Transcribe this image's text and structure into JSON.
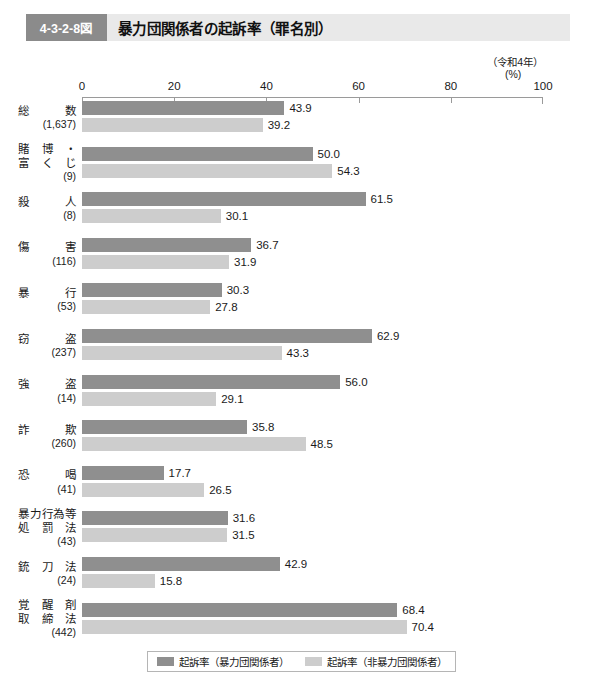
{
  "header": {
    "figure_number": "4-3-2-8図",
    "title": "暴力団関係者の起訴率（罪名別）"
  },
  "notes": {
    "year": "（令和4年）",
    "unit": "(%)"
  },
  "legend": {
    "items": [
      {
        "label": "起訴率（暴力団関係者）",
        "color": "#8f8f8f"
      },
      {
        "label": "起訴率（非暴力団関係者）",
        "color": "#cdcdcd"
      }
    ]
  },
  "chart_data": {
    "type": "bar",
    "orientation": "horizontal",
    "title": "暴力団関係者の起訴率（罪名別）",
    "subtitle": "（令和4年）",
    "xlabel": "(%)",
    "ylabel": "",
    "xlim": [
      0,
      100
    ],
    "xticks": [
      0,
      20,
      40,
      60,
      80,
      100
    ],
    "xticklabels": [
      "0",
      "20",
      "40",
      "60",
      "80",
      "100"
    ],
    "grid": false,
    "legend_position": "bottom",
    "categories": [
      {
        "name": "総　　数",
        "count": "(1,637)"
      },
      {
        "name": "賭博・\n富くじ",
        "count": "(9)",
        "lines": [
          "賭　博　・",
          "富　く　じ"
        ]
      },
      {
        "name": "殺　　人",
        "count": "(8)"
      },
      {
        "name": "傷　　害",
        "count": "(116)"
      },
      {
        "name": "暴　　行",
        "count": "(53)"
      },
      {
        "name": "窃　　盗",
        "count": "(237)"
      },
      {
        "name": "強　　盗",
        "count": "(14)"
      },
      {
        "name": "詐　　欺",
        "count": "(260)"
      },
      {
        "name": "恐　　喝",
        "count": "(41)"
      },
      {
        "name": "暴力行為等\n処罰法",
        "count": "(43)",
        "lines": [
          "暴力行為等",
          "処　罰　法"
        ]
      },
      {
        "name": "銃　刀　法",
        "count": "(24)"
      },
      {
        "name": "覚醒剤\n取締法",
        "count": "(442)",
        "lines": [
          "覚　醒　剤",
          "取　締　法"
        ]
      }
    ],
    "series": [
      {
        "name": "起訴率（暴力団関係者）",
        "color": "#8f8f8f",
        "values": [
          43.9,
          50.0,
          61.5,
          36.7,
          30.3,
          62.9,
          56.0,
          35.8,
          17.7,
          31.6,
          42.9,
          68.4
        ],
        "labels": [
          "43.9",
          "50.0",
          "61.5",
          "36.7",
          "30.3",
          "62.9",
          "56.0",
          "35.8",
          "17.7",
          "31.6",
          "42.9",
          "68.4"
        ]
      },
      {
        "name": "起訴率（非暴力団関係者）",
        "color": "#cdcdcd",
        "values": [
          39.2,
          54.3,
          30.1,
          31.9,
          27.8,
          43.3,
          29.1,
          48.5,
          26.5,
          31.5,
          15.8,
          70.4
        ],
        "labels": [
          "39.2",
          "54.3",
          "30.1",
          "31.9",
          "27.8",
          "43.3",
          "29.1",
          "48.5",
          "26.5",
          "31.5",
          "15.8",
          "70.4"
        ]
      }
    ]
  }
}
